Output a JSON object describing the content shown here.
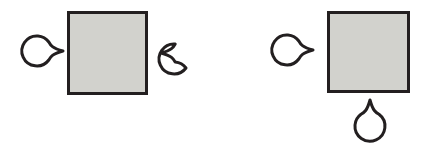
{
  "figure": {
    "width": 434,
    "height": 148,
    "background_color": "#FFFFFF",
    "style": {
      "square_fill_color": "#D2D2CD",
      "square_stroke_color": "#231F20",
      "square_stroke_width": 3,
      "circle_fill_color": "#FFFFFF",
      "circle_stroke_color": "#231F20",
      "circle_stroke_width": 3
    },
    "groups": [
      {
        "name": "configuration-left",
        "label": "",
        "square": {
          "name": "square-left",
          "x": 67,
          "y": 11,
          "width": 81,
          "height": 84
        },
        "circles": [
          {
            "name": "circle-left-outer",
            "cx": 38,
            "cy": 51,
            "r": 15,
            "point_direction": "right",
            "point_length": 10
          },
          {
            "name": "circle-left-inner-right",
            "cx": 186,
            "cy": 53,
            "r": 15,
            "point_direction": "left",
            "point_length": 10
          }
        ]
      },
      {
        "name": "configuration-right",
        "label": "",
        "square": {
          "name": "square-right",
          "x": 327,
          "y": 11,
          "width": 83,
          "height": 82
        },
        "circles": [
          {
            "name": "circle-right-outer-left",
            "cx": 288,
            "cy": 50,
            "r": 15,
            "point_direction": "right",
            "point_length": 10
          },
          {
            "name": "circle-right-bottom",
            "cx": 370,
            "cy": 125,
            "r": 15,
            "point_direction": "up",
            "point_length": 10
          }
        ]
      }
    ]
  }
}
